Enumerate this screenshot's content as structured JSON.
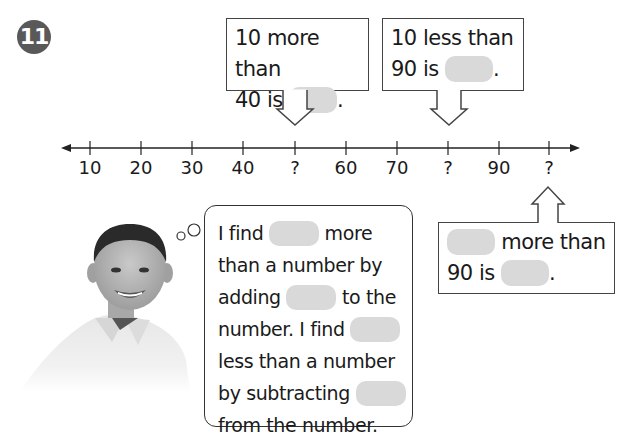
{
  "problem": {
    "number": "11",
    "badge_color": "#595959"
  },
  "callouts": [
    {
      "line1": "10 more than",
      "line2_prefix": "40 is",
      "line2_suffix": ".",
      "arrow": "down",
      "points_to": "?"
    },
    {
      "line1": "10 less than",
      "line2_prefix": "90 is",
      "line2_suffix": ".",
      "arrow": "down",
      "points_to": "?"
    },
    {
      "line1_suffix": "more than",
      "line2_prefix": "90 is",
      "line2_suffix": ".",
      "arrow": "up",
      "points_to": "?"
    }
  ],
  "number_line": {
    "labels": [
      "10",
      "20",
      "30",
      "40",
      "?",
      "60",
      "70",
      "?",
      "90",
      "?"
    ]
  },
  "thought_bubble": {
    "lines": [
      {
        "before": "I find",
        "after": "more"
      },
      {
        "text": "than a number by"
      },
      {
        "before": "adding",
        "after": "to the"
      },
      {
        "before": "number. I find",
        "after": ""
      },
      {
        "text": "less than a number"
      },
      {
        "before": "by subtracting",
        "after": ""
      },
      {
        "text": "from the number."
      }
    ]
  },
  "colors": {
    "blank_fill": "#d9d9d9",
    "line": "#333333"
  },
  "image": {
    "description": "smiling boy in white polo shirt"
  }
}
